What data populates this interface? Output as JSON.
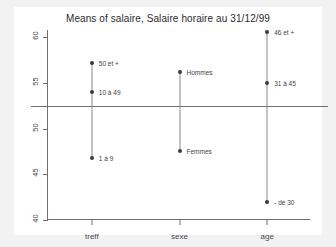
{
  "chart_data": {
    "type": "scatter",
    "title": "Means of salaire, Salaire horaire au 31/12/99",
    "xlabel": "",
    "ylabel": "",
    "ylim": [
      40,
      60.8
    ],
    "yticks": [
      40,
      45,
      50,
      55,
      60
    ],
    "ytick_labels": [
      "40",
      "45",
      "50",
      "55",
      "60"
    ],
    "grid": false,
    "legend": "none",
    "grand_mean": 52.5,
    "categories": [
      "treff",
      "sexe",
      "age"
    ],
    "series": [
      {
        "name": "treff",
        "points": [
          {
            "label": "50 et +",
            "value": 57.2
          },
          {
            "label": "10 à 49",
            "value": 54.0
          },
          {
            "label": "1 à 9",
            "value": 46.8
          }
        ]
      },
      {
        "name": "sexe",
        "points": [
          {
            "label": "Hommes",
            "value": 56.2
          },
          {
            "label": "Femmes",
            "value": 47.6
          }
        ]
      },
      {
        "name": "age",
        "points": [
          {
            "label": "46 et +",
            "value": 60.6
          },
          {
            "label": "31 à 45",
            "value": 55.0
          },
          {
            "label": "- de 30",
            "value": 42.0
          }
        ]
      }
    ],
    "colors": {
      "page_background": "#f2f2f2",
      "panel_background": "#ffffff",
      "axis": "#6f6f6f",
      "point": "#3a3a3a",
      "stem": "#8a8a8a",
      "mean_line": "#707070",
      "text": "#4a4a4a"
    }
  }
}
